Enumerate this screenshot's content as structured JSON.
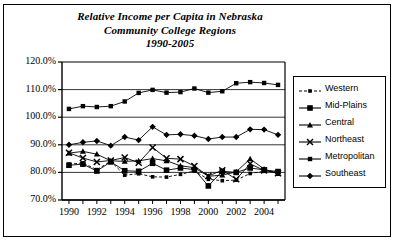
{
  "chart_data": {
    "type": "line",
    "title": "Relative Income per Capita in Nebraska Community College Regions 1990-2005",
    "title_lines": [
      "Relative Income per Capita in Nebraska",
      "Community College Regions",
      "1990-2005"
    ],
    "xlabel": "",
    "ylabel": "",
    "x": [
      1990,
      1991,
      1992,
      1993,
      1994,
      1995,
      1996,
      1997,
      1998,
      1999,
      2000,
      2001,
      2002,
      2003,
      2004,
      2005
    ],
    "xlim": [
      1989.5,
      2005.5
    ],
    "ylim": [
      70,
      120
    ],
    "y_ticks": [
      70,
      80,
      90,
      100,
      110,
      120
    ],
    "y_tick_labels": [
      "70.0%",
      "80.0%",
      "90.0%",
      "100.0%",
      "110.0%",
      "120.0%"
    ],
    "x_tick_labels_shown": [
      "1990",
      "1992",
      "1994",
      "1996",
      "1998",
      "2000",
      "2002",
      "2004"
    ],
    "x_ticks_all": [
      1990,
      1991,
      1992,
      1993,
      1994,
      1995,
      1996,
      1997,
      1998,
      1999,
      2000,
      2001,
      2002,
      2003,
      2004,
      2005
    ],
    "grid": "horizontal",
    "legend_position": "right-outside",
    "series": [
      {
        "name": "Western",
        "marker": "small-square",
        "values": [
          83.0,
          83.4,
          81.0,
          84.0,
          79.0,
          79.5,
          78.4,
          78.3,
          79.3,
          80.5,
          77.5,
          77.0,
          77.2,
          79.6,
          80.4,
          80.2
        ]
      },
      {
        "name": "Mid-Plains",
        "marker": "large-square",
        "values": [
          82.6,
          83.0,
          80.5,
          83.8,
          80.6,
          80.4,
          83.3,
          80.8,
          81.6,
          81.0,
          75.1,
          80.4,
          80.0,
          81.6,
          80.9,
          80.3
        ]
      },
      {
        "name": "Central",
        "marker": "triangle",
        "values": [
          87.0,
          87.6,
          86.6,
          84.2,
          84.0,
          84.2,
          85.0,
          84.2,
          82.4,
          81.7,
          78.6,
          79.0,
          80.2,
          84.9,
          81.2,
          79.6
        ]
      },
      {
        "name": "Northeast",
        "marker": "x-cross",
        "values": [
          87.1,
          85.2,
          83.8,
          84.3,
          85.4,
          83.5,
          89.0,
          85.1,
          84.8,
          82.3,
          78.7,
          80.8,
          77.5,
          83.1,
          80.7,
          79.7
        ]
      },
      {
        "name": "Metropolitan",
        "marker": "medium-square",
        "values": [
          103.0,
          104.0,
          103.7,
          104.0,
          105.7,
          108.8,
          109.9,
          108.9,
          109.1,
          110.4,
          108.9,
          109.4,
          112.3,
          112.7,
          112.4,
          111.7
        ]
      },
      {
        "name": "Southeast",
        "marker": "diamond",
        "values": [
          90.0,
          90.9,
          91.4,
          89.7,
          92.8,
          91.7,
          96.5,
          93.6,
          93.8,
          93.3,
          92.1,
          92.8,
          92.8,
          95.6,
          95.5,
          93.6
        ]
      }
    ]
  },
  "legend": {
    "entries": [
      {
        "label": "Western"
      },
      {
        "label": "Mid-Plains"
      },
      {
        "label": "Central"
      },
      {
        "label": "Northeast"
      },
      {
        "label": "Metropolitan"
      },
      {
        "label": "Southeast"
      }
    ]
  },
  "colors": {
    "line": "#000000",
    "background": "#ffffff",
    "grid": "#000000",
    "axis": "#000000"
  }
}
